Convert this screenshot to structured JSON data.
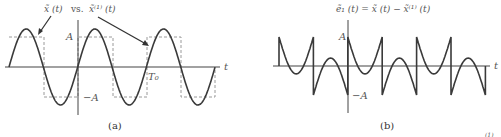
{
  "panel_a": {
    "title_left": "x̃ (t)",
    "title_vs": "vs.",
    "title_right": "x̃⁽¹⁾ (t)",
    "label_A": "A",
    "label_negA": "−A",
    "label_T0": "T₀",
    "label_t": "t",
    "caption": "(a)"
  },
  "panel_b": {
    "title": "ẽ₁ (t) = x̃ (t) − x̃⁽¹⁾ (t)",
    "label_A": "A",
    "label_negA": "−A",
    "label_t": "t",
    "caption": "(b)"
  },
  "footer_fragment": "(1)",
  "colors": {
    "curve": "#3a3a3a",
    "dashed": "#9a9a9a",
    "axis": "#444444",
    "text": "#555555"
  }
}
